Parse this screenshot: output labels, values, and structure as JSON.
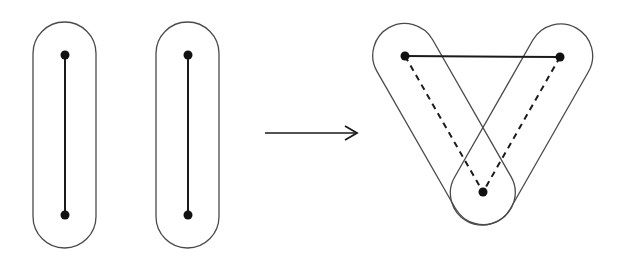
{
  "diagram": {
    "colors": {
      "stroke": "#1a1a1a",
      "capsule": "#4a4a4a",
      "background": "#ffffff"
    },
    "left": {
      "capsules": [
        {
          "id": "capsule-1",
          "top": [
            65,
            55
          ],
          "bottom": [
            65,
            215
          ]
        },
        {
          "id": "capsule-2",
          "top": [
            188,
            55
          ],
          "bottom": [
            188,
            215
          ]
        }
      ]
    },
    "arrow": {
      "from": [
        265,
        133
      ],
      "to": [
        358,
        133
      ],
      "label": ""
    },
    "right": {
      "vertices": [
        [
          405,
          56
        ],
        [
          560,
          57
        ],
        [
          483,
          192
        ]
      ],
      "solid_edges": [
        [
          0,
          1
        ]
      ],
      "dashed_edges": [
        [
          0,
          2
        ],
        [
          1,
          2
        ]
      ]
    }
  }
}
